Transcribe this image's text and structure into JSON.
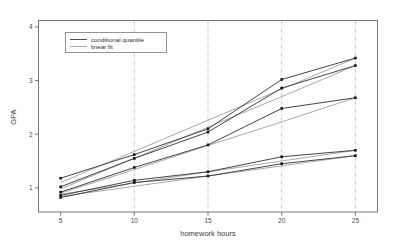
{
  "chart_data": {
    "type": "line",
    "title": "",
    "xlabel": "homework hours",
    "ylabel": "GPA",
    "xlim": [
      3.5,
      26.5
    ],
    "ylim": [
      0.55,
      4.12
    ],
    "xticks": [
      5,
      10,
      15,
      20,
      25
    ],
    "yticks": [
      1,
      2,
      3,
      4
    ],
    "xtick_labels": [
      "5",
      "10",
      "15",
      "20",
      "25"
    ],
    "ytick_labels": [
      "1",
      "2",
      "3",
      "4"
    ],
    "grid": false,
    "vertical_reference_lines": [
      10,
      15,
      20,
      25
    ],
    "legend": {
      "position": "top-left",
      "entries": [
        {
          "label": "conditional quantile",
          "style": "solid-dark"
        },
        {
          "label": "linear fit",
          "style": "solid-light"
        }
      ]
    },
    "x": [
      5,
      10,
      15,
      20,
      25
    ],
    "series": [
      {
        "name": "conditional quantile q1",
        "kind": "conditional quantile",
        "markers": true,
        "values": [
          1.18,
          1.62,
          2.1,
          3.02,
          3.42
        ]
      },
      {
        "name": "conditional quantile q2",
        "kind": "conditional quantile",
        "markers": true,
        "values": [
          1.02,
          1.55,
          2.04,
          2.86,
          3.28
        ]
      },
      {
        "name": "conditional quantile q3",
        "kind": "conditional quantile",
        "markers": true,
        "values": [
          0.92,
          1.38,
          1.8,
          2.48,
          2.68
        ]
      },
      {
        "name": "conditional quantile q4",
        "kind": "conditional quantile",
        "markers": true,
        "values": [
          0.86,
          1.14,
          1.3,
          1.58,
          1.7
        ]
      },
      {
        "name": "conditional quantile q5",
        "kind": "conditional quantile",
        "markers": true,
        "values": [
          0.82,
          1.1,
          1.22,
          1.45,
          1.6
        ]
      },
      {
        "name": "linear fit q1",
        "kind": "linear fit",
        "markers": false,
        "values": [
          1.1,
          1.68,
          2.26,
          2.84,
          3.42
        ]
      },
      {
        "name": "linear fit q2",
        "kind": "linear fit",
        "markers": false,
        "values": [
          0.98,
          1.55,
          2.13,
          2.7,
          3.28
        ]
      },
      {
        "name": "linear fit q3",
        "kind": "linear fit",
        "markers": false,
        "values": [
          0.9,
          1.34,
          1.79,
          2.23,
          2.68
        ]
      },
      {
        "name": "linear fit q4",
        "kind": "linear fit",
        "markers": false,
        "values": [
          0.88,
          1.09,
          1.3,
          1.5,
          1.7
        ]
      },
      {
        "name": "linear fit q5",
        "kind": "linear fit",
        "markers": false,
        "values": [
          0.84,
          1.03,
          1.22,
          1.41,
          1.6
        ]
      }
    ],
    "colors": {
      "quantile_line": "#3b3b3b",
      "fit_line": "#8c8c8c",
      "axis": "#555555",
      "marker": "#151515",
      "reference_line": "#999999",
      "background": "#ffffff"
    }
  }
}
